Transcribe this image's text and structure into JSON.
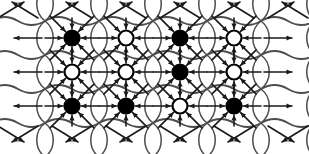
{
  "figure": {
    "kind": "vector-field-lattice-diagram",
    "width": 309,
    "height": 154,
    "background_color": "#ffffff",
    "stroke_color": "#1a1a1a",
    "separatrix_color": "#4d4d4d",
    "filled_node_color": "#000000",
    "open_node_fill": "#ffffff",
    "open_node_stroke": "#000000"
  },
  "lattice": {
    "columns": 4,
    "rows": 3,
    "origin_x": 72,
    "origin_y": 38,
    "spacing_x": 54,
    "spacing_y": 34,
    "node_radius": 7.5,
    "node_stroke_width": 2.2,
    "nodes": [
      {
        "row": 0,
        "col": 0,
        "x": 72,
        "y": 38,
        "type": "filled"
      },
      {
        "row": 0,
        "col": 1,
        "x": 126,
        "y": 38,
        "type": "open"
      },
      {
        "row": 0,
        "col": 2,
        "x": 180,
        "y": 38,
        "type": "filled"
      },
      {
        "row": 0,
        "col": 3,
        "x": 234,
        "y": 38,
        "type": "open"
      },
      {
        "row": 1,
        "col": 0,
        "x": 72,
        "y": 72,
        "type": "open"
      },
      {
        "row": 1,
        "col": 1,
        "x": 126,
        "y": 72,
        "type": "open"
      },
      {
        "row": 1,
        "col": 2,
        "x": 180,
        "y": 72,
        "type": "filled"
      },
      {
        "row": 1,
        "col": 3,
        "x": 234,
        "y": 72,
        "type": "open"
      },
      {
        "row": 2,
        "col": 0,
        "x": 72,
        "y": 106,
        "type": "filled"
      },
      {
        "row": 2,
        "col": 1,
        "x": 126,
        "y": 106,
        "type": "filled"
      },
      {
        "row": 2,
        "col": 2,
        "x": 180,
        "y": 106,
        "type": "open"
      },
      {
        "row": 2,
        "col": 3,
        "x": 234,
        "y": 106,
        "type": "filled"
      }
    ]
  },
  "flow": {
    "description": "arrows converge inward toward every lattice node",
    "arrow_directions_deg": [
      0,
      45,
      90,
      135,
      180,
      225,
      270,
      315
    ],
    "arrow_inner_radius": 9,
    "arrow_outer_radius": 27,
    "arrow_stroke_width": 1.6,
    "arrowhead_length": 5.5,
    "arrowhead_halfwidth": 2.6,
    "horizontal_arrow_outer_radius": 27,
    "diagonal_arrow_outer_radius": 31,
    "vertical_arrow_outer_radius": 20
  },
  "separatrices": {
    "description": "curved lens-shaped separatrix arcs bounding each basin",
    "stroke_width": 1.5,
    "vertical_arc_bulge": 11,
    "horizontal_arc_bulge": 8
  }
}
